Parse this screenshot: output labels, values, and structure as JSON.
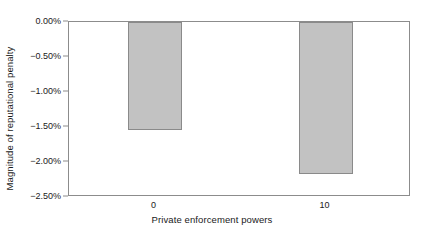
{
  "chart_data": {
    "type": "bar",
    "title": "",
    "xlabel": "Private enforcement powers",
    "ylabel": "Magnitude of reputational penalty",
    "categories": [
      "0",
      "10"
    ],
    "values": [
      -0.0154,
      -0.0217
    ],
    "value_labels": [
      "-1.54%",
      "-2.17%"
    ],
    "ylim": [
      -0.025,
      0.0
    ],
    "ytick_values": [
      0.0,
      -0.005,
      -0.01,
      -0.015,
      -0.02,
      -0.025
    ],
    "ytick_labels": [
      "0.00%",
      "−0.50%",
      "−1.00%",
      "−1.50%",
      "−2.00%",
      "−2.50%"
    ],
    "grid": false,
    "legend": null,
    "bar_fill_color": "#c2c2c2",
    "bar_border_color": "#8a8a8a",
    "axis_color": "#8c8c8c",
    "background_color": "#ffffff"
  }
}
